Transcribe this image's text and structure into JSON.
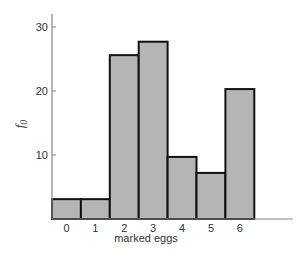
{
  "chart_data": {
    "type": "bar",
    "title": "",
    "xlabel": "marked eggs",
    "ylabel": "f",
    "ylabel_subscript": "0",
    "categories": [
      "0",
      "1",
      "2",
      "3",
      "4",
      "5",
      "6"
    ],
    "values": [
      3.1,
      3.1,
      25.6,
      27.7,
      9.7,
      7.2,
      20.3
    ],
    "ylim": [
      0,
      32
    ],
    "yticks": [
      10,
      20,
      30
    ],
    "grid": false,
    "legend": null,
    "colors": {
      "bar_fill": "#b5b5b5",
      "bar_edge": "#111111",
      "axis": "#888888"
    }
  }
}
